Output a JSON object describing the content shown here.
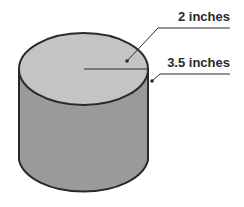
{
  "diagram": {
    "shape": "cylinder",
    "labels": {
      "radius": "2 inches",
      "height": "3.5 inches"
    },
    "colors": {
      "top_face": "#c4c4c4",
      "side_face": "#9a9a9a",
      "outline": "#2a2a2a",
      "background": "#ffffff"
    }
  }
}
